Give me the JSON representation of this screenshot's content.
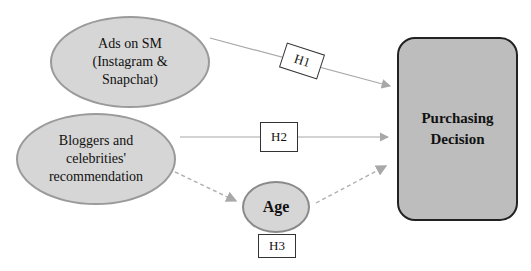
{
  "diagram": {
    "nodes": {
      "ads": {
        "lines": [
          "Ads on SM",
          "(Instagram &",
          "Snapchat)"
        ]
      },
      "bloggers": {
        "lines": [
          "Bloggers and",
          "celebrities'",
          "recommendation"
        ]
      },
      "age": {
        "label": "Age"
      },
      "purchasing": {
        "lines": [
          "Purchasing",
          "Decision"
        ]
      }
    },
    "hypotheses": {
      "h1": "H1",
      "h2": "H2",
      "h3": "H3"
    },
    "edges": [
      {
        "from": "ads",
        "to": "purchasing",
        "label": "H1",
        "style": "solid"
      },
      {
        "from": "bloggers",
        "to": "purchasing",
        "label": "H2",
        "style": "solid"
      },
      {
        "from": "bloggers",
        "to": "age",
        "label": "H3",
        "style": "dashed"
      },
      {
        "from": "age",
        "to": "purchasing",
        "label": "H3",
        "style": "dashed"
      }
    ],
    "colors": {
      "ellipse_fill": "#d6d6d6",
      "ellipse_border": "#9a9a9a",
      "target_fill": "#bdbdbd",
      "target_border": "#222222",
      "arrow": "#a8a8a8"
    }
  }
}
